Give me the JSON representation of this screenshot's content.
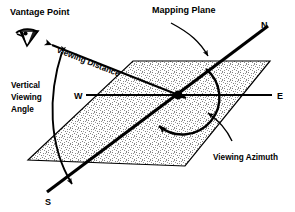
{
  "figure": {
    "background_color": "#ffffff",
    "line_color": "#000000",
    "plane_fill": "#d8d8d8"
  },
  "labels": {
    "vantage_point": "Vantage Point",
    "mapping_plane": "Mapping Plane",
    "viewing_distance": "Viewing  Distance",
    "vertical_viewing_angle_line1": "Vertical",
    "vertical_viewing_angle_line2": "Viewing",
    "vertical_viewing_angle_line3": "Angle",
    "viewing_azimuth": "Viewing  Azimuth"
  },
  "compass": {
    "north": "N",
    "east": "E",
    "south": "S",
    "west": "W"
  },
  "icons": {
    "eye_icon": "eye-icon",
    "arrow_head": "arrow-head"
  },
  "geometry": {
    "plane_corners": [
      [
        28,
        160
      ],
      [
        133,
        61
      ],
      [
        270,
        61
      ],
      [
        185,
        166
      ]
    ],
    "center_point": [
      178,
      95
    ],
    "ns_axis": [
      [
        47,
        192
      ],
      [
        268,
        26
      ]
    ],
    "ew_axis": [
      [
        86,
        95
      ],
      [
        272,
        95
      ]
    ],
    "viewing_distance_line": [
      [
        50,
        44
      ],
      [
        190,
        100
      ]
    ],
    "vantage_point": [
      42,
      41
    ]
  }
}
